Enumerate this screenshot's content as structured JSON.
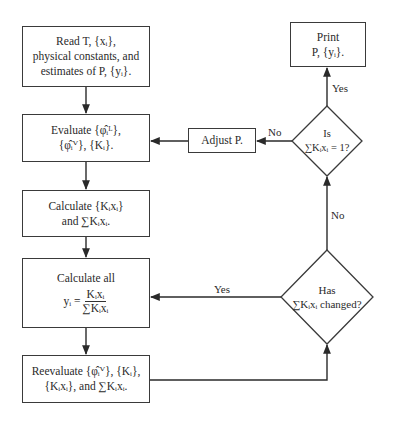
{
  "diagram": {
    "type": "flowchart",
    "nodes": {
      "read": {
        "line1": "Read T, {xᵢ},",
        "line2": "physical constants, and",
        "line3": "estimates of P, {yᵢ}."
      },
      "evaluate": {
        "line1": "Evaluate {φ̂ᵢᴸ},",
        "line2": "{φ̂ᵢⱽ}, {Kᵢ}."
      },
      "calc_kx": {
        "line1": "Calculate {Kᵢxᵢ}",
        "line2": "and ∑Kᵢxᵢ."
      },
      "calc_y": {
        "line1": "Calculate all",
        "lhs": "yᵢ =",
        "numerator": "Kᵢxᵢ",
        "denominator": "∑Kᵢxᵢ"
      },
      "reevaluate": {
        "line1": "Reevaluate {φ̂ᵢⱽ}, {Kᵢ},",
        "line2": "{Kᵢxᵢ}, and ∑Kᵢxᵢ."
      },
      "changed": {
        "line1": "Has",
        "line2": "∑Kᵢxᵢ changed?"
      },
      "is_one": {
        "line1": "Is",
        "line2": "∑Kᵢxᵢ = 1?"
      },
      "adjust": {
        "line1": "Adjust P."
      },
      "print": {
        "line1": "Print",
        "line2": "P, {yᵢ}."
      }
    },
    "edge_labels": {
      "changed_yes": "Yes",
      "changed_no": "No",
      "is_one_yes": "Yes",
      "is_one_no": "No"
    },
    "edges": [
      {
        "from": "read",
        "to": "evaluate"
      },
      {
        "from": "evaluate",
        "to": "calc_kx"
      },
      {
        "from": "calc_kx",
        "to": "calc_y"
      },
      {
        "from": "calc_y",
        "to": "reevaluate"
      },
      {
        "from": "reevaluate",
        "to": "changed"
      },
      {
        "from": "changed",
        "to": "calc_y",
        "label": "Yes"
      },
      {
        "from": "changed",
        "to": "is_one",
        "label": "No"
      },
      {
        "from": "is_one",
        "to": "print",
        "label": "Yes"
      },
      {
        "from": "is_one",
        "to": "adjust",
        "label": "No"
      },
      {
        "from": "adjust",
        "to": "evaluate"
      }
    ]
  }
}
